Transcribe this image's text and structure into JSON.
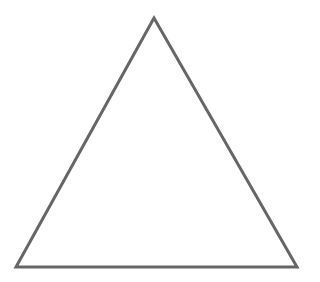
{
  "diagram": {
    "shape": "triangle",
    "stroke_color": "#666666",
    "fill_color": "#ffffff",
    "stroke_width": 3,
    "vertices": {
      "apex": [
        154,
        18
      ],
      "bottom_left": [
        16,
        267
      ],
      "bottom_right": [
        297,
        267
      ]
    }
  }
}
